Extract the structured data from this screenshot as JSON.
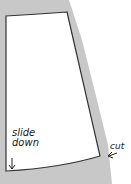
{
  "diagram": {
    "type": "sewing-pattern-piece",
    "fabric_color": "#c8c8c8",
    "pattern_fill": "#ffffff",
    "outline_color": "#333333",
    "labels": {
      "slide_line1": "slide",
      "slide_line2": "down",
      "cut": "cut"
    },
    "arrows": [
      {
        "name": "slide-down-arrow",
        "direction": "down"
      },
      {
        "name": "cut-arrow",
        "direction": "left"
      }
    ]
  }
}
